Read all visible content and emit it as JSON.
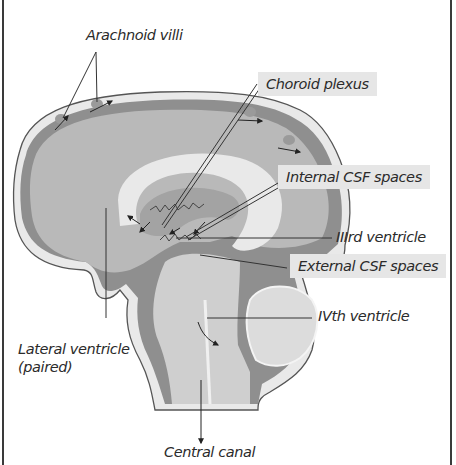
{
  "figure": {
    "title_fragment": "",
    "colors": {
      "label_box": "#e6e6e6",
      "csf_dark": "#8f8f8f",
      "tissue_mid": "#b9b9b9",
      "tissue_light": "#d4d4d4",
      "pale_white_matter": "#e9e9e9",
      "outline": "#555555",
      "frame": "#3a3a3a"
    },
    "labels": {
      "arachnoid_villi": "Arachnoid villi",
      "choroid_plexus": "Choroid plexus",
      "internal_csf": "Internal CSF spaces",
      "third_ventricle": "IIIrd ventricle",
      "external_csf": "External CSF spaces",
      "fourth_ventricle": "IVth ventricle",
      "lateral_ventricle_line1": "Lateral ventricle",
      "lateral_ventricle_line2": "(paired)",
      "central_canal": "Central canal"
    }
  }
}
